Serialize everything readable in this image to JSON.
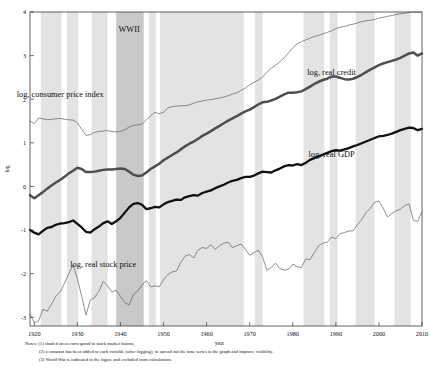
{
  "figure": {
    "axis_label_y": "log",
    "axis_label_x": "year",
    "war_band_label": "WWII"
  },
  "series_labels": {
    "cpi": "log, consumer price index",
    "credit": "log, real credit",
    "gdp": "log, real GDP",
    "stock": "log, real stock price"
  },
  "notes": {
    "line1": "Notes: (1) shaded areas correspond to stock market booms,",
    "line2": "(2) a constant has been added to each variable (after logging), to spread out the time series in the graph and improve visibility.",
    "line3": "(3) World War is indicated in the figure and excluded from calculations"
  },
  "colors": {
    "axis": "#3a3a3a",
    "band_boom": "#e3e3e3",
    "band_war": "#c9c9c9",
    "gdp_line": "#111111",
    "credit_line": "#4e4e4e",
    "thin_line": "#555555",
    "text": "#111111"
  },
  "chart_data": {
    "type": "line",
    "title": "",
    "xlabel": "year",
    "ylabel": "log",
    "xlim": [
      1919,
      2010
    ],
    "ylim": [
      -3.2,
      4.0
    ],
    "xticks": [
      1920,
      1930,
      1940,
      1950,
      1960,
      1970,
      1980,
      1990,
      2000,
      2010
    ],
    "yticks": [
      -3,
      -2,
      -1,
      0,
      1,
      2,
      3,
      4
    ],
    "grid": false,
    "legend": "inline-annotations",
    "annotations": [
      {
        "text": "WWII",
        "x": 1942,
        "y": 3.55
      },
      {
        "text": "log, consumer price index",
        "x": 1926,
        "y": 2.05
      },
      {
        "text": "log, real credit",
        "x": 1989,
        "y": 2.55
      },
      {
        "text": "log, real GDP",
        "x": 1989,
        "y": 0.68
      },
      {
        "text": "log, real stock price",
        "x": 1936,
        "y": -1.85
      }
    ],
    "shaded_bands": [
      {
        "kind": "boom",
        "start": 1921.5,
        "end": 1926.3
      },
      {
        "kind": "boom",
        "start": 1927.6,
        "end": 1930.2
      },
      {
        "kind": "boom",
        "start": 1933.3,
        "end": 1937.0
      },
      {
        "kind": "war",
        "start": 1939.0,
        "end": 1945.4
      },
      {
        "kind": "boom",
        "start": 1946.6,
        "end": 1948.2
      },
      {
        "kind": "boom",
        "start": 1949.2,
        "end": 1968.6
      },
      {
        "kind": "boom",
        "start": 1971.2,
        "end": 1973.0
      },
      {
        "kind": "boom",
        "start": 1982.5,
        "end": 1987.3
      },
      {
        "kind": "boom",
        "start": 1988.6,
        "end": 1990.4
      },
      {
        "kind": "boom",
        "start": 1994.6,
        "end": 1999.0
      },
      {
        "kind": "boom",
        "start": 2003.6,
        "end": 2007.4
      }
    ],
    "series": [
      {
        "name": "log, consumer price index",
        "style": "thin",
        "x": [
          1919,
          1920,
          1921,
          1922,
          1923,
          1924,
          1925,
          1926,
          1927,
          1928,
          1929,
          1930,
          1931,
          1932,
          1933,
          1934,
          1935,
          1936,
          1937,
          1938,
          1939,
          1940,
          1941,
          1942,
          1943,
          1944,
          1945,
          1946,
          1947,
          1948,
          1949,
          1950,
          1951,
          1952,
          1953,
          1954,
          1955,
          1956,
          1957,
          1958,
          1959,
          1960,
          1961,
          1962,
          1963,
          1964,
          1965,
          1966,
          1967,
          1968,
          1969,
          1970,
          1971,
          1972,
          1973,
          1974,
          1975,
          1976,
          1977,
          1978,
          1979,
          1980,
          1981,
          1982,
          1983,
          1984,
          1985,
          1986,
          1987,
          1988,
          1989,
          1990,
          1991,
          1992,
          1993,
          1994,
          1995,
          1996,
          1997,
          1998,
          1999,
          2000,
          2001,
          2002,
          2003,
          2004,
          2005,
          2006,
          2007,
          2008,
          2009,
          2010
        ],
        "y": [
          1.5,
          1.44,
          1.57,
          1.55,
          1.53,
          1.54,
          1.55,
          1.56,
          1.54,
          1.53,
          1.52,
          1.46,
          1.31,
          1.17,
          1.19,
          1.24,
          1.26,
          1.27,
          1.28,
          1.26,
          1.25,
          1.26,
          1.3,
          1.36,
          1.4,
          1.41,
          1.43,
          1.52,
          1.62,
          1.7,
          1.67,
          1.7,
          1.8,
          1.83,
          1.84,
          1.85,
          1.85,
          1.87,
          1.91,
          1.94,
          1.96,
          1.98,
          1.99,
          2.01,
          2.03,
          2.05,
          2.08,
          2.12,
          2.15,
          2.2,
          2.26,
          2.33,
          2.39,
          2.44,
          2.51,
          2.62,
          2.71,
          2.78,
          2.86,
          2.95,
          3.06,
          3.18,
          3.27,
          3.32,
          3.36,
          3.4,
          3.44,
          3.46,
          3.5,
          3.53,
          3.57,
          3.62,
          3.65,
          3.67,
          3.7,
          3.72,
          3.75,
          3.78,
          3.8,
          3.81,
          3.83,
          3.86,
          3.88,
          3.9,
          3.92,
          3.94,
          3.96,
          3.97,
          3.99,
          4.0,
          3.99,
          4.0
        ]
      },
      {
        "name": "log, real credit",
        "style": "thick-gray",
        "x": [
          1919,
          1920,
          1921,
          1922,
          1923,
          1924,
          1925,
          1926,
          1927,
          1928,
          1929,
          1930,
          1931,
          1932,
          1933,
          1934,
          1935,
          1936,
          1937,
          1938,
          1939,
          1940,
          1941,
          1942,
          1943,
          1944,
          1945,
          1946,
          1947,
          1948,
          1949,
          1950,
          1951,
          1952,
          1953,
          1954,
          1955,
          1956,
          1957,
          1958,
          1959,
          1960,
          1961,
          1962,
          1963,
          1964,
          1965,
          1966,
          1967,
          1968,
          1969,
          1970,
          1971,
          1972,
          1973,
          1974,
          1975,
          1976,
          1977,
          1978,
          1979,
          1980,
          1981,
          1982,
          1983,
          1984,
          1985,
          1986,
          1987,
          1988,
          1989,
          1990,
          1991,
          1992,
          1993,
          1994,
          1995,
          1996,
          1997,
          1998,
          1999,
          2000,
          2001,
          2002,
          2003,
          2004,
          2005,
          2006,
          2007,
          2008,
          2009,
          2010
        ],
        "y": [
          -0.2,
          -0.27,
          -0.2,
          -0.13,
          -0.05,
          0.02,
          0.09,
          0.15,
          0.22,
          0.3,
          0.36,
          0.43,
          0.4,
          0.33,
          0.33,
          0.34,
          0.36,
          0.38,
          0.39,
          0.39,
          0.4,
          0.41,
          0.4,
          0.34,
          0.27,
          0.24,
          0.25,
          0.32,
          0.4,
          0.46,
          0.52,
          0.6,
          0.66,
          0.72,
          0.78,
          0.85,
          0.92,
          0.98,
          1.03,
          1.09,
          1.16,
          1.21,
          1.27,
          1.33,
          1.39,
          1.45,
          1.51,
          1.56,
          1.61,
          1.67,
          1.72,
          1.76,
          1.82,
          1.88,
          1.93,
          1.94,
          1.97,
          2.01,
          2.06,
          2.11,
          2.15,
          2.15,
          2.16,
          2.18,
          2.23,
          2.29,
          2.35,
          2.4,
          2.44,
          2.47,
          2.52,
          2.52,
          2.49,
          2.46,
          2.45,
          2.47,
          2.51,
          2.56,
          2.62,
          2.68,
          2.73,
          2.78,
          2.82,
          2.85,
          2.88,
          2.91,
          2.95,
          3.0,
          3.05,
          3.07,
          3.0,
          3.05
        ]
      },
      {
        "name": "log, real GDP",
        "style": "thick-black",
        "x": [
          1919,
          1920,
          1921,
          1922,
          1923,
          1924,
          1925,
          1926,
          1927,
          1928,
          1929,
          1930,
          1931,
          1932,
          1933,
          1934,
          1935,
          1936,
          1937,
          1938,
          1939,
          1940,
          1941,
          1942,
          1943,
          1944,
          1945,
          1946,
          1947,
          1948,
          1949,
          1950,
          1951,
          1952,
          1953,
          1954,
          1955,
          1956,
          1957,
          1958,
          1959,
          1960,
          1961,
          1962,
          1963,
          1964,
          1965,
          1966,
          1967,
          1968,
          1969,
          1970,
          1971,
          1972,
          1973,
          1974,
          1975,
          1976,
          1977,
          1978,
          1979,
          1980,
          1981,
          1982,
          1983,
          1984,
          1985,
          1986,
          1987,
          1988,
          1989,
          1990,
          1991,
          1992,
          1993,
          1994,
          1995,
          1996,
          1997,
          1998,
          1999,
          2000,
          2001,
          2002,
          2003,
          2004,
          2005,
          2006,
          2007,
          2008,
          2009,
          2010
        ],
        "y": [
          -1.0,
          -1.06,
          -1.1,
          -1.02,
          -0.95,
          -0.93,
          -0.88,
          -0.85,
          -0.84,
          -0.82,
          -0.78,
          -0.86,
          -0.94,
          -1.04,
          -1.06,
          -0.98,
          -0.92,
          -0.84,
          -0.8,
          -0.86,
          -0.8,
          -0.72,
          -0.6,
          -0.48,
          -0.4,
          -0.38,
          -0.42,
          -0.52,
          -0.5,
          -0.47,
          -0.48,
          -0.41,
          -0.36,
          -0.33,
          -0.3,
          -0.31,
          -0.25,
          -0.22,
          -0.2,
          -0.21,
          -0.15,
          -0.12,
          -0.09,
          -0.04,
          0.0,
          0.04,
          0.09,
          0.13,
          0.15,
          0.19,
          0.22,
          0.22,
          0.25,
          0.3,
          0.34,
          0.33,
          0.32,
          0.37,
          0.41,
          0.46,
          0.49,
          0.48,
          0.51,
          0.49,
          0.54,
          0.61,
          0.65,
          0.69,
          0.73,
          0.77,
          0.81,
          0.83,
          0.82,
          0.85,
          0.88,
          0.92,
          0.95,
          0.99,
          1.03,
          1.07,
          1.11,
          1.15,
          1.16,
          1.18,
          1.21,
          1.25,
          1.29,
          1.32,
          1.35,
          1.34,
          1.29,
          1.32
        ]
      },
      {
        "name": "log, real stock price",
        "style": "thin",
        "x": [
          1919,
          1920,
          1921,
          1922,
          1923,
          1924,
          1925,
          1926,
          1927,
          1928,
          1929,
          1930,
          1931,
          1932,
          1933,
          1934,
          1935,
          1936,
          1937,
          1938,
          1939,
          1940,
          1941,
          1942,
          1943,
          1944,
          1945,
          1946,
          1947,
          1948,
          1949,
          1950,
          1951,
          1952,
          1953,
          1954,
          1955,
          1956,
          1957,
          1958,
          1959,
          1960,
          1961,
          1962,
          1963,
          1964,
          1965,
          1966,
          1967,
          1968,
          1969,
          1970,
          1971,
          1972,
          1973,
          1974,
          1975,
          1976,
          1977,
          1978,
          1979,
          1980,
          1981,
          1982,
          1983,
          1984,
          1985,
          1986,
          1987,
          1988,
          1989,
          1990,
          1991,
          1992,
          1993,
          1994,
          1995,
          1996,
          1997,
          1998,
          1999,
          2000,
          2001,
          2002,
          2003,
          2004,
          2005,
          2006,
          2007,
          2008,
          2009,
          2010
        ],
        "y": [
          -2.93,
          -3.12,
          -3.08,
          -2.82,
          -2.86,
          -2.7,
          -2.52,
          -2.42,
          -2.22,
          -2.0,
          -1.8,
          -2.12,
          -2.52,
          -2.95,
          -2.6,
          -2.55,
          -2.4,
          -2.18,
          -2.28,
          -2.42,
          -2.38,
          -2.52,
          -2.66,
          -2.72,
          -2.48,
          -2.4,
          -2.26,
          -2.16,
          -2.3,
          -2.28,
          -2.3,
          -2.14,
          -2.02,
          -1.96,
          -1.94,
          -1.74,
          -1.6,
          -1.56,
          -1.64,
          -1.46,
          -1.4,
          -1.42,
          -1.34,
          -1.44,
          -1.36,
          -1.3,
          -1.28,
          -1.4,
          -1.36,
          -1.32,
          -1.44,
          -1.58,
          -1.52,
          -1.46,
          -1.62,
          -1.92,
          -1.86,
          -1.76,
          -1.88,
          -1.92,
          -1.9,
          -1.78,
          -1.84,
          -1.86,
          -1.66,
          -1.68,
          -1.52,
          -1.36,
          -1.3,
          -1.28,
          -1.16,
          -1.2,
          -1.08,
          -1.06,
          -1.02,
          -1.02,
          -0.88,
          -0.76,
          -0.6,
          -0.5,
          -0.36,
          -0.34,
          -0.5,
          -0.7,
          -0.62,
          -0.56,
          -0.52,
          -0.44,
          -0.4,
          -0.78,
          -0.8,
          -0.58
        ]
      }
    ]
  }
}
